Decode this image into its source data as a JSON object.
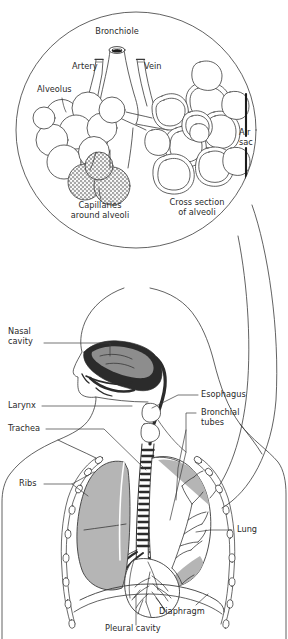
{
  "figure": {
    "stroke_color": "#3a3a3a",
    "lung_fill": "#b5b5b5",
    "nasal_fill": "#2e2e2e",
    "nasal_inner_fill": "#8e8e8e",
    "capillary_fill": "#ffffff",
    "background": "#ffffff"
  },
  "detail_circle": {
    "name": "magnified-alveoli-detail",
    "labels": {
      "bronchiole": "Bronchiole",
      "artery": "Artery",
      "vein": "Vein",
      "alveolus": "Alveolus",
      "air_sac": "Air\nsac",
      "capillaries": "Capillaries\naround alveoli",
      "cross_section": "Cross section\nof alveoli"
    }
  },
  "body_diagram": {
    "name": "torso-respiratory-anatomy",
    "labels": {
      "nasal_cavity": "Nasal\ncavity",
      "larynx": "Larynx",
      "trachea": "Trachea",
      "esophagus": "Esophagus",
      "bronchial_tubes": "Bronchial\ntubes",
      "ribs": "Ribs",
      "lung": "Lung",
      "diaphragm": "Diaphragm",
      "pleural_cavity": "Pleural cavity"
    }
  }
}
